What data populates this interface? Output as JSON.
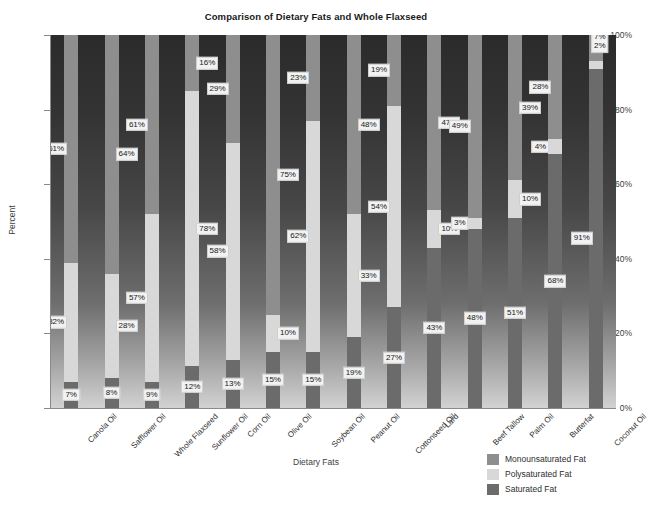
{
  "chart_data": {
    "type": "bar",
    "subtype": "stacked-100-percent",
    "title": "Comparison of Dietary Fats and Whole Flaxseed",
    "xlabel": "Dietary Fats",
    "ylabel": "Percent",
    "ylim": [
      0,
      100
    ],
    "ytick_labels": [
      "0%",
      "20%",
      "40%",
      "60%",
      "80%",
      "100%"
    ],
    "ytick_values": [
      0,
      20,
      40,
      60,
      80,
      100
    ],
    "grid": false,
    "legend_position": "bottom-right",
    "value_label_suffix": "%",
    "categories": [
      "Canola Oil",
      "Safflower Oil",
      "Whole Flaxseed",
      "Sunflower Oil",
      "Corn Oil",
      "Olive Oil",
      "Soybean Oil",
      "Peanut Oil",
      "Cottonseed Oil",
      "Lard",
      "Beef Tallow",
      "Palm Oil",
      "Butterfat",
      "Coconut Oil"
    ],
    "series": [
      {
        "name": "Monounsaturated Fat",
        "color": "#8e8e8e",
        "values": [
          61,
          64,
          61,
          16,
          29,
          75,
          23,
          48,
          19,
          47,
          49,
          39,
          28,
          7
        ]
      },
      {
        "name": "Polysaturated Fat",
        "color": "#d8d8d8",
        "values": [
          32,
          28,
          57,
          78,
          58,
          10,
          62,
          33,
          54,
          10,
          3,
          10,
          4,
          2
        ]
      },
      {
        "name": "Saturated Fat",
        "color": "#6b6b6b",
        "values": [
          7,
          8,
          9,
          12,
          13,
          15,
          15,
          19,
          27,
          43,
          48,
          51,
          68,
          91
        ]
      }
    ],
    "annotations": []
  },
  "legend": {
    "items": [
      {
        "label": "Monounsaturated Fat",
        "color": "#8e8e8e"
      },
      {
        "label": "Polysaturated Fat",
        "color": "#d8d8d8"
      },
      {
        "label": "Saturated Fat",
        "color": "#6b6b6b"
      }
    ]
  },
  "footer": {
    "note": ""
  }
}
